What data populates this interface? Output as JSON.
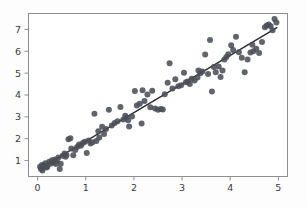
{
  "chart_data": {
    "type": "scatter",
    "title": "",
    "xlabel": "",
    "ylabel": "",
    "xlim": [
      -0.2,
      5.2
    ],
    "ylim": [
      0.25,
      7.75
    ],
    "grid": false,
    "legend": null,
    "xticks": [
      0,
      1,
      2,
      3,
      4,
      5
    ],
    "xtick_labels": [
      "0",
      "1",
      "2",
      "3",
      "4",
      "5"
    ],
    "yticks": [
      1,
      2,
      3,
      4,
      5,
      6,
      7
    ],
    "ytick_labels": [
      "1",
      "2",
      "3",
      "4",
      "5",
      "6",
      "7"
    ],
    "marker_color": "#4a4f57",
    "line_color": "#2b2b2b",
    "axis_color": "#8d8d8d",
    "background_color": "#fdfdfd",
    "marker_size": 3.0,
    "series": [
      {
        "name": "observations",
        "type": "scatter",
        "points": [
          [
            0.05,
            0.72
          ],
          [
            0.07,
            0.62
          ],
          [
            0.09,
            0.8
          ],
          [
            0.1,
            0.55
          ],
          [
            0.13,
            0.78
          ],
          [
            0.16,
            0.88
          ],
          [
            0.2,
            0.72
          ],
          [
            0.24,
            0.95
          ],
          [
            0.27,
            0.86
          ],
          [
            0.3,
            1.02
          ],
          [
            0.33,
            0.93
          ],
          [
            0.36,
            1.05
          ],
          [
            0.4,
            0.99
          ],
          [
            0.43,
            1.14
          ],
          [
            0.46,
            0.62
          ],
          [
            0.48,
            0.86
          ],
          [
            0.52,
            1.22
          ],
          [
            0.56,
            1.32
          ],
          [
            0.6,
            1.26
          ],
          [
            0.64,
            1.98
          ],
          [
            0.68,
            2.02
          ],
          [
            0.7,
            1.55
          ],
          [
            0.74,
            1.24
          ],
          [
            0.78,
            1.48
          ],
          [
            0.82,
            1.62
          ],
          [
            0.86,
            1.74
          ],
          [
            0.9,
            1.68
          ],
          [
            0.94,
            1.8
          ],
          [
            0.98,
            1.86
          ],
          [
            1.02,
            1.35
          ],
          [
            1.06,
            1.92
          ],
          [
            1.1,
            1.78
          ],
          [
            1.14,
            1.84
          ],
          [
            1.18,
            3.14
          ],
          [
            1.22,
            1.9
          ],
          [
            1.28,
            2.06
          ],
          [
            1.34,
            2.55
          ],
          [
            1.38,
            2.22
          ],
          [
            1.42,
            2.45
          ],
          [
            1.48,
            3.32
          ],
          [
            1.54,
            2.6
          ],
          [
            1.6,
            2.72
          ],
          [
            1.66,
            2.8
          ],
          [
            1.72,
            3.45
          ],
          [
            1.78,
            2.88
          ],
          [
            1.82,
            3.05
          ],
          [
            1.84,
            2.96
          ],
          [
            1.88,
            2.84
          ],
          [
            1.9,
            2.56
          ],
          [
            1.96,
            3.02
          ],
          [
            2.02,
            4.18
          ],
          [
            2.06,
            3.52
          ],
          [
            2.12,
            3.6
          ],
          [
            2.16,
            2.7
          ],
          [
            2.22,
            3.72
          ],
          [
            2.28,
            4.02
          ],
          [
            2.34,
            3.44
          ],
          [
            2.38,
            4.2
          ],
          [
            2.44,
            3.38
          ],
          [
            2.5,
            3.32
          ],
          [
            2.56,
            3.36
          ],
          [
            2.6,
            3.34
          ],
          [
            2.64,
            4.04
          ],
          [
            2.7,
            4.56
          ],
          [
            2.74,
            5.45
          ],
          [
            2.8,
            4.3
          ],
          [
            2.86,
            4.72
          ],
          [
            2.92,
            4.4
          ],
          [
            2.98,
            4.45
          ],
          [
            3.04,
            5.02
          ],
          [
            3.08,
            4.58
          ],
          [
            3.12,
            4.62
          ],
          [
            3.16,
            4.5
          ],
          [
            3.2,
            4.74
          ],
          [
            3.26,
            4.66
          ],
          [
            3.32,
            4.8
          ],
          [
            3.38,
            5.0
          ],
          [
            3.42,
            5.08
          ],
          [
            3.48,
            5.85
          ],
          [
            3.54,
            4.96
          ],
          [
            3.58,
            6.52
          ],
          [
            3.62,
            4.16
          ],
          [
            3.66,
            5.28
          ],
          [
            3.7,
            5.04
          ],
          [
            3.76,
            5.3
          ],
          [
            3.8,
            4.82
          ],
          [
            3.84,
            5.12
          ],
          [
            3.88,
            5.62
          ],
          [
            3.92,
            5.74
          ],
          [
            3.96,
            5.86
          ],
          [
            4.02,
            6.28
          ],
          [
            4.06,
            6.06
          ],
          [
            4.12,
            6.66
          ],
          [
            4.18,
            5.96
          ],
          [
            4.24,
            5.7
          ],
          [
            4.3,
            5.04
          ],
          [
            4.36,
            5.62
          ],
          [
            4.42,
            5.94
          ],
          [
            4.48,
            6.0
          ],
          [
            4.54,
            6.12
          ],
          [
            4.6,
            5.92
          ],
          [
            4.66,
            6.42
          ],
          [
            4.72,
            7.1
          ],
          [
            4.76,
            7.18
          ],
          [
            4.8,
            7.22
          ],
          [
            4.84,
            7.14
          ],
          [
            4.88,
            6.96
          ],
          [
            4.92,
            7.48
          ],
          [
            4.96,
            7.32
          ],
          [
            0.18,
            0.68
          ],
          [
            0.38,
            0.84
          ],
          [
            0.58,
            1.18
          ],
          [
            1.26,
            2.34
          ],
          [
            2.18,
            4.22
          ],
          [
            3.34,
            5.12
          ],
          [
            4.46,
            6.3
          ]
        ]
      },
      {
        "name": "linear-fit",
        "type": "line",
        "slope": 1.308,
        "intercept": 0.58,
        "endpoints": [
          [
            0.05,
            0.645
          ],
          [
            4.97,
            7.08
          ]
        ]
      }
    ]
  },
  "axes": {
    "plot_left_px": 28,
    "plot_right_px": 288,
    "plot_top_px": 13,
    "plot_bottom_px": 177
  }
}
